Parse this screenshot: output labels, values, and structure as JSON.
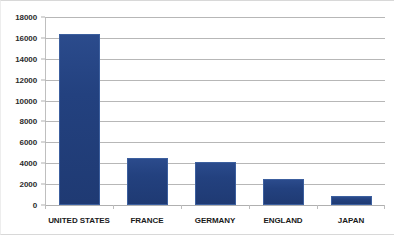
{
  "chart_data": {
    "type": "bar",
    "title": "",
    "subtitle": "",
    "xlabel": "",
    "ylabel": "",
    "categories": [
      "UNITED STATES",
      "FRANCE",
      "GERMANY",
      "ENGLAND",
      "JAPAN"
    ],
    "values": [
      16400,
      4500,
      4150,
      2500,
      900
    ],
    "series": [
      {
        "name": "",
        "values": [
          16400,
          4500,
          4150,
          2500,
          900
        ]
      }
    ],
    "ylim": [
      0,
      18000
    ],
    "ytick_step": 2000,
    "ytick_labels": [
      "0",
      "2000",
      "4000",
      "6000",
      "8000",
      "10000",
      "12000",
      "14000",
      "16000",
      "18000"
    ],
    "ytick_values": [
      0,
      2000,
      4000,
      6000,
      8000,
      10000,
      12000,
      14000,
      16000,
      18000
    ],
    "grid": "horizontal",
    "legend": "none",
    "annotations": [],
    "colors": {
      "bar_fill": "#23417f",
      "bar_edge": "#3c5f9e",
      "gridline": "#b7b7b7",
      "axis": "#b0b0b0",
      "label_text": "#1a1a1a",
      "background": "#ffffff"
    }
  }
}
